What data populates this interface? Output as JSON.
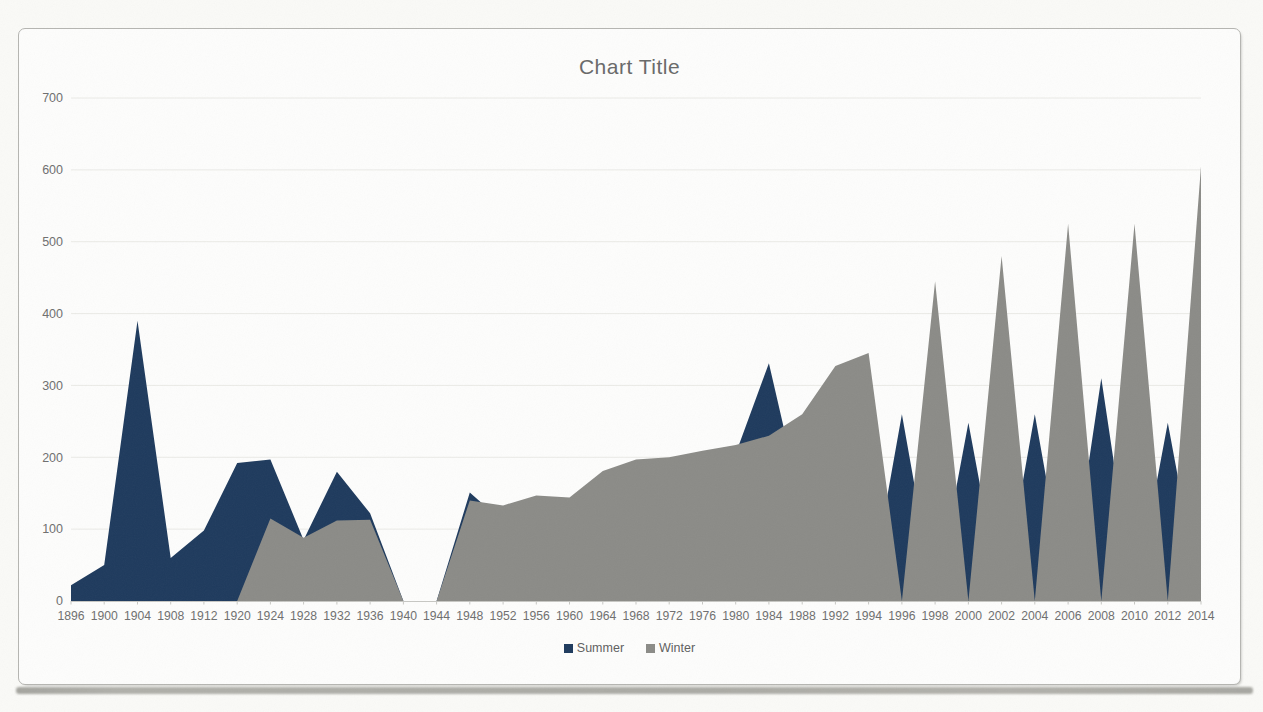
{
  "page": {
    "background": "#fafaf7",
    "card_background": "#fdfdfc",
    "card_border": "#b5b5b1",
    "bottom_shadow_color": "#a3a39d"
  },
  "chart": {
    "colors": {
      "summer": "#1e3a5d",
      "winter": "#8b8b87",
      "gridline": "#eaeae6",
      "axis_line": "#c7c7c3",
      "axis_text": "#6f6f6f",
      "title_text": "#696969",
      "legend_text": "#5f5f5f"
    }
  },
  "chart_data": {
    "type": "area",
    "title": "Chart Title",
    "xlabel": "",
    "ylabel": "",
    "ylim": [
      0,
      700
    ],
    "yticks": [
      0,
      100,
      200,
      300,
      400,
      500,
      600,
      700
    ],
    "grid": true,
    "legend_position": "bottom",
    "categories": [
      "1896",
      "1900",
      "1904",
      "1908",
      "1912",
      "1920",
      "1924",
      "1928",
      "1932",
      "1936",
      "1940",
      "1944",
      "1948",
      "1952",
      "1956",
      "1960",
      "1964",
      "1968",
      "1972",
      "1976",
      "1980",
      "1984",
      "1988",
      "1992",
      "1994",
      "1996",
      "1998",
      "2000",
      "2002",
      "2004",
      "2006",
      "2008",
      "2010",
      "2012",
      "2014"
    ],
    "series": [
      {
        "name": "Summer",
        "color": "#1e3a5d",
        "values": [
          22,
          50,
          390,
          60,
          98,
          192,
          197,
          85,
          180,
          122,
          0,
          0,
          151,
          110,
          130,
          135,
          165,
          185,
          190,
          198,
          205,
          331,
          130,
          320,
          0,
          260,
          0,
          248,
          0,
          260,
          0,
          310,
          0,
          248,
          0
        ]
      },
      {
        "name": "Winter",
        "color": "#8b8b87",
        "values": [
          0,
          0,
          0,
          0,
          0,
          0,
          115,
          88,
          112,
          113,
          0,
          0,
          140,
          133,
          147,
          144,
          181,
          197,
          200,
          209,
          217,
          230,
          260,
          327,
          345,
          0,
          445,
          0,
          480,
          0,
          525,
          0,
          525,
          0,
          605
        ]
      }
    ]
  }
}
